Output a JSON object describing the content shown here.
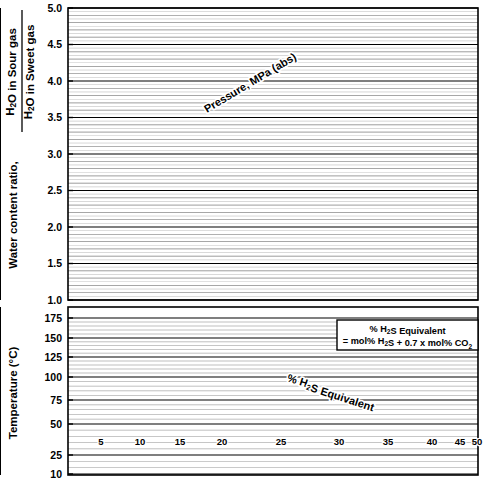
{
  "figure": {
    "background": "#ffffff",
    "ink": "#000000"
  },
  "top_chart_axis": {
    "ylabel_main": "Water content ratio,",
    "ylabel_num": "H₂O in Sour gas",
    "ylabel_den": "H₂O in Sweet gas",
    "yticks": [
      "5.0",
      "4.5",
      "4.0",
      "3.5",
      "3.0",
      "2.5",
      "2.0",
      "1.5",
      "1.0"
    ],
    "series_title": "Pressure, MPa (abs)"
  },
  "bottom_chart_axis": {
    "ylabel": "Temperature (°C)",
    "yticks": [
      "175",
      "150",
      "125",
      "100",
      "75",
      "50",
      "25",
      "10"
    ],
    "annotation": "% H₂S Equivalent",
    "legend_line1": "% H₂S Equivalent",
    "legend_line2": "= mol% H₂S + 0.7 x mol% CO₂"
  },
  "chart_data": [
    {
      "id": "water-content-ratio",
      "type": "line",
      "title": "",
      "xlabel": "",
      "ylabel": "Water content ratio, H2O in Sour gas / H2O in Sweet gas",
      "ylim": [
        1.0,
        5.0
      ],
      "yticks": [
        1.0,
        1.5,
        2.0,
        2.5,
        3.0,
        3.5,
        4.0,
        4.5,
        5.0
      ],
      "xscale": "log",
      "xlim": [
        1,
        100
      ],
      "grid": true,
      "legend": "inline-curve-labels",
      "series_label": "Pressure, MPa (abs)",
      "series": [
        {
          "name": "70",
          "style": "solid",
          "label": "70",
          "y_at_right": 5.0
        },
        {
          "name": "60",
          "style": "solid",
          "label": "60",
          "y_at_right": 4.9
        },
        {
          "name": "50",
          "style": "solid",
          "label": "50",
          "y_at_right": 4.7
        },
        {
          "name": "40",
          "style": "solid",
          "label": "40",
          "y_at_right": 4.4
        },
        {
          "name": "30",
          "style": "solid",
          "label": "30",
          "y_at_right": 4.0
        },
        {
          "name": "25",
          "style": "solid",
          "label": "25",
          "y_at_right": 3.7
        },
        {
          "name": "22",
          "style": "solid",
          "label": "22",
          "y_at_right": 3.5
        },
        {
          "name": "20",
          "style": "solid",
          "label": "20",
          "y_at_right": 3.35
        },
        {
          "name": "15",
          "style": "solid",
          "label": "15",
          "y_at_right": 2.85
        },
        {
          "name": "10",
          "style": "solid",
          "label": "10",
          "y_at_right": 2.25
        },
        {
          "name": "5",
          "style": "solid",
          "label": "5",
          "y_at_right": 1.55
        },
        {
          "name": "2",
          "style": "dashed",
          "label": "2",
          "y_at_right": 1.12
        }
      ]
    },
    {
      "id": "h2s-equivalent",
      "type": "line",
      "title": "",
      "xlabel": "",
      "ylabel": "Temperature (°C)",
      "ylim": [
        10,
        180
      ],
      "yticks": [
        10,
        25,
        50,
        75,
        100,
        125,
        150,
        175
      ],
      "xscale": "log",
      "xlim": [
        1,
        100
      ],
      "grid": true,
      "legend": "inline-curve-labels",
      "series_label": "% H2S Equivalent",
      "series": [
        {
          "name": "5",
          "style": "dashed",
          "label": "5"
        },
        {
          "name": "10",
          "style": "solid",
          "label": "10"
        },
        {
          "name": "15",
          "style": "dashed",
          "label": "15"
        },
        {
          "name": "20",
          "style": "solid",
          "label": "20"
        },
        {
          "name": "25",
          "style": "dashed",
          "label": "25"
        },
        {
          "name": "30",
          "style": "solid",
          "label": "30"
        },
        {
          "name": "35",
          "style": "dashed",
          "label": "35"
        },
        {
          "name": "40",
          "style": "solid",
          "label": "40"
        },
        {
          "name": "45",
          "style": "dashed",
          "label": "45"
        },
        {
          "name": "50",
          "style": "solid",
          "label": "50"
        }
      ]
    }
  ]
}
